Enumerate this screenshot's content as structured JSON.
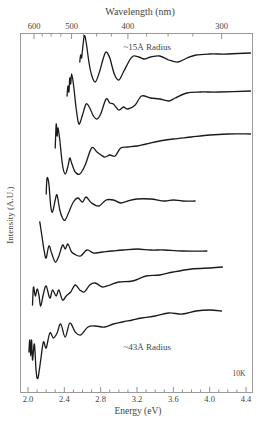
{
  "chart_data": {
    "type": "line",
    "title": "",
    "xlabel": "Energy (eV)",
    "ylabel": "Intensity (A.U.)",
    "top_xlabel": "Wavelength (nm)",
    "xlim": [
      1.92,
      4.48
    ],
    "x_ticks": [
      2.0,
      2.4,
      2.8,
      3.2,
      3.6,
      4.0,
      4.4
    ],
    "x_tick_labels": [
      "2.0",
      "2.4",
      "2.8",
      "3.2",
      "3.6",
      "4.0",
      "4.4"
    ],
    "top_ticks_nm": [
      600,
      500,
      400,
      300
    ],
    "top_tick_labels": [
      "600",
      "500",
      "400",
      "300"
    ],
    "grid": false,
    "annotations": [
      {
        "text": "~15Å Radius",
        "x": 3.05,
        "y_px": 50
      },
      {
        "text": "~43Å Radius",
        "x": 3.05,
        "y_px": 350
      },
      {
        "text": "10K",
        "x": 4.25,
        "y_px": 376
      }
    ],
    "series_note": "Absorption spectra, vertically offset; y values are relative plot-pixel positions (smaller = higher intensity)",
    "series": [
      {
        "name": "~15Å Radius",
        "points": [
          [
            2.57,
            62
          ],
          [
            2.58,
            55
          ],
          [
            2.59,
            58
          ],
          [
            2.6,
            50
          ],
          [
            2.62,
            36
          ],
          [
            2.64,
            42
          ],
          [
            2.67,
            62
          ],
          [
            2.7,
            75
          ],
          [
            2.74,
            82
          ],
          [
            2.78,
            74
          ],
          [
            2.83,
            58
          ],
          [
            2.86,
            52
          ],
          [
            2.9,
            58
          ],
          [
            2.95,
            74
          ],
          [
            3.0,
            80
          ],
          [
            3.05,
            72
          ],
          [
            3.12,
            60
          ],
          [
            3.16,
            56
          ],
          [
            3.22,
            57
          ],
          [
            3.28,
            59
          ],
          [
            3.35,
            57
          ],
          [
            3.45,
            56
          ],
          [
            3.55,
            60
          ],
          [
            3.65,
            62
          ],
          [
            3.75,
            58
          ],
          [
            3.85,
            55
          ],
          [
            4.0,
            54
          ],
          [
            4.2,
            54
          ],
          [
            4.45,
            53
          ]
        ]
      },
      {
        "name": "series-2",
        "points": [
          [
            2.43,
            96
          ],
          [
            2.44,
            86
          ],
          [
            2.45,
            92
          ],
          [
            2.46,
            78
          ],
          [
            2.47,
            84
          ],
          [
            2.48,
            74
          ],
          [
            2.5,
            84
          ],
          [
            2.53,
            108
          ],
          [
            2.56,
            124
          ],
          [
            2.6,
            115
          ],
          [
            2.64,
            104
          ],
          [
            2.68,
            108
          ],
          [
            2.72,
            116
          ],
          [
            2.76,
            119
          ],
          [
            2.8,
            114
          ],
          [
            2.86,
            99
          ],
          [
            2.9,
            103
          ],
          [
            2.94,
            104
          ],
          [
            3.0,
            110
          ],
          [
            3.05,
            107
          ],
          [
            3.1,
            109
          ],
          [
            3.18,
            105
          ],
          [
            3.25,
            96
          ],
          [
            3.35,
            98
          ],
          [
            3.45,
            99
          ],
          [
            3.55,
            101
          ],
          [
            3.62,
            98
          ],
          [
            3.75,
            93
          ],
          [
            3.9,
            92
          ],
          [
            4.1,
            92
          ],
          [
            4.45,
            91
          ]
        ]
      },
      {
        "name": "series-3",
        "points": [
          [
            2.3,
            148
          ],
          [
            2.31,
            124
          ],
          [
            2.32,
            136
          ],
          [
            2.33,
            128
          ],
          [
            2.35,
            140
          ],
          [
            2.38,
            165
          ],
          [
            2.41,
            174
          ],
          [
            2.44,
            166
          ],
          [
            2.46,
            158
          ],
          [
            2.48,
            163
          ],
          [
            2.52,
            172
          ],
          [
            2.57,
            174
          ],
          [
            2.63,
            165
          ],
          [
            2.7,
            148
          ],
          [
            2.76,
            152
          ],
          [
            2.84,
            157
          ],
          [
            2.9,
            155
          ],
          [
            2.96,
            156
          ],
          [
            3.02,
            148
          ],
          [
            3.1,
            147
          ],
          [
            3.2,
            146
          ],
          [
            3.3,
            144
          ],
          [
            3.45,
            141
          ],
          [
            3.6,
            139
          ],
          [
            3.8,
            137
          ],
          [
            4.0,
            135
          ],
          [
            4.2,
            134
          ],
          [
            4.45,
            134
          ]
        ]
      },
      {
        "name": "series-4",
        "points": [
          [
            2.2,
            194
          ],
          [
            2.21,
            178
          ],
          [
            2.23,
            184
          ],
          [
            2.25,
            206
          ],
          [
            2.27,
            212
          ],
          [
            2.3,
            200
          ],
          [
            2.32,
            195
          ],
          [
            2.35,
            210
          ],
          [
            2.38,
            218
          ],
          [
            2.41,
            220
          ],
          [
            2.45,
            212
          ],
          [
            2.5,
            202
          ],
          [
            2.55,
            198
          ],
          [
            2.6,
            202
          ],
          [
            2.64,
            197
          ],
          [
            2.7,
            203
          ],
          [
            2.78,
            206
          ],
          [
            2.86,
            200
          ],
          [
            2.94,
            200
          ],
          [
            3.02,
            203
          ],
          [
            3.1,
            201
          ],
          [
            3.2,
            199
          ],
          [
            3.35,
            199
          ],
          [
            3.5,
            201
          ],
          [
            3.6,
            200
          ],
          [
            3.7,
            201
          ],
          [
            3.84,
            201
          ]
        ]
      },
      {
        "name": "series-5",
        "points": [
          [
            2.13,
            222
          ],
          [
            2.14,
            228
          ],
          [
            2.16,
            240
          ],
          [
            2.18,
            252
          ],
          [
            2.2,
            258
          ],
          [
            2.23,
            246
          ],
          [
            2.26,
            253
          ],
          [
            2.3,
            262
          ],
          [
            2.34,
            256
          ],
          [
            2.38,
            245
          ],
          [
            2.41,
            249
          ],
          [
            2.44,
            244
          ],
          [
            2.48,
            252
          ],
          [
            2.53,
            255
          ],
          [
            2.58,
            256
          ],
          [
            2.65,
            250
          ],
          [
            2.72,
            253
          ],
          [
            2.82,
            252
          ],
          [
            2.92,
            251
          ],
          [
            3.05,
            250
          ],
          [
            3.2,
            249
          ],
          [
            3.35,
            250
          ],
          [
            3.5,
            250
          ],
          [
            3.7,
            251
          ],
          [
            3.97,
            251
          ]
        ]
      },
      {
        "name": "series-6",
        "points": [
          [
            2.05,
            305
          ],
          [
            2.06,
            287
          ],
          [
            2.08,
            296
          ],
          [
            2.1,
            289
          ],
          [
            2.12,
            295
          ],
          [
            2.14,
            306
          ],
          [
            2.17,
            294
          ],
          [
            2.2,
            286
          ],
          [
            2.24,
            298
          ],
          [
            2.27,
            290
          ],
          [
            2.31,
            296
          ],
          [
            2.34,
            290
          ],
          [
            2.38,
            300
          ],
          [
            2.42,
            296
          ],
          [
            2.47,
            292
          ],
          [
            2.52,
            285
          ],
          [
            2.57,
            290
          ],
          [
            2.62,
            292
          ],
          [
            2.68,
            285
          ],
          [
            2.74,
            283
          ],
          [
            2.82,
            287
          ],
          [
            2.9,
            285
          ],
          [
            3.0,
            282
          ],
          [
            3.15,
            281
          ],
          [
            3.3,
            276
          ],
          [
            3.45,
            275
          ],
          [
            3.6,
            272
          ],
          [
            3.8,
            269
          ],
          [
            4.0,
            268
          ],
          [
            4.14,
            267
          ]
        ]
      },
      {
        "name": "~43Å Radius",
        "points": [
          [
            2.01,
            352
          ],
          [
            2.02,
            340
          ],
          [
            2.03,
            356
          ],
          [
            2.04,
            340
          ],
          [
            2.05,
            360
          ],
          [
            2.07,
            344
          ],
          [
            2.09,
            372
          ],
          [
            2.11,
            378
          ],
          [
            2.14,
            360
          ],
          [
            2.17,
            342
          ],
          [
            2.2,
            348
          ],
          [
            2.24,
            333
          ],
          [
            2.28,
            338
          ],
          [
            2.32,
            333
          ],
          [
            2.36,
            324
          ],
          [
            2.41,
            337
          ],
          [
            2.46,
            323
          ],
          [
            2.52,
            332
          ],
          [
            2.58,
            335
          ],
          [
            2.66,
            327
          ],
          [
            2.74,
            326
          ],
          [
            2.84,
            327
          ],
          [
            2.94,
            324
          ],
          [
            3.04,
            322
          ],
          [
            3.15,
            320
          ],
          [
            3.25,
            318
          ],
          [
            3.4,
            316
          ],
          [
            3.55,
            313
          ],
          [
            3.7,
            314
          ],
          [
            3.85,
            311
          ],
          [
            4.0,
            310
          ],
          [
            4.13,
            311
          ]
        ]
      }
    ]
  }
}
